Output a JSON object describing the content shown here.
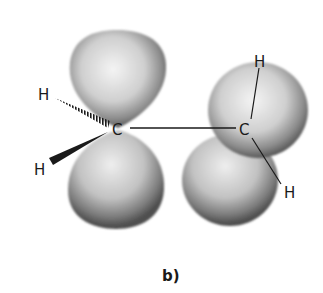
{
  "diagram": {
    "caption": "b)",
    "atoms": {
      "carbon_left": "C",
      "carbon_right": "C",
      "h_left_top": "H",
      "h_left_bottom": "H",
      "h_right_top": "H",
      "h_right_bottom": "H"
    },
    "colors": {
      "lobe_light": "#f2f2f2",
      "lobe_dark": "#5a5a5a",
      "bond": "#1a1a1a"
    }
  }
}
